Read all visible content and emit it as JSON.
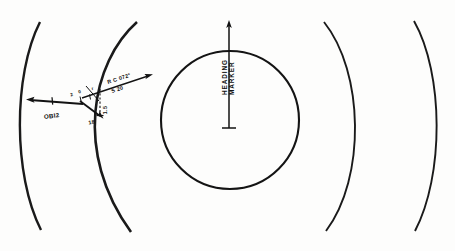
{
  "figure": {
    "background_color": "#fdfdfc",
    "ink_color": "#121212"
  },
  "center_display": {
    "circle_label": "range-ring",
    "heading_marker": {
      "line_1": "HEADING",
      "line_2": "MARKER",
      "name": "heading-marker"
    }
  },
  "range_arcs": [
    {
      "id": "arc-left-outer",
      "side": "left"
    },
    {
      "id": "arc-left-inner",
      "side": "left"
    },
    {
      "id": "arc-right-inner",
      "side": "right"
    },
    {
      "id": "arc-right-outer",
      "side": "right"
    }
  ],
  "vector_plot": {
    "annotations": {
      "own_ship_label": "OBI2",
      "bearing_label": "R C 072°",
      "speed_label": "S 20",
      "tick_a": "2",
      "tick_b": "0",
      "tick_c": "r",
      "dim_vertical": "1.5",
      "dim_lower": "18"
    }
  },
  "colors": {
    "ink": "#121212",
    "paper": "#fdfdfc"
  }
}
